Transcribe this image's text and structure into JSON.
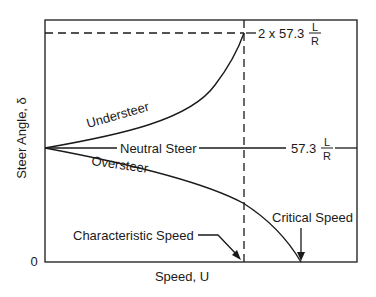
{
  "diagram": {
    "title": "",
    "x_axis": {
      "label": "Speed, U",
      "origin_label": "0"
    },
    "y_axis": {
      "label": "Steer Angle, δ"
    },
    "curves": [
      {
        "name": "Understeer",
        "label": "Understeer"
      },
      {
        "name": "Neutral Steer",
        "label": "Neutral Steer"
      },
      {
        "name": "Oversteer",
        "label": "Oversteer"
      }
    ],
    "annotations": {
      "upper_level_prefix": "2 x 57.3",
      "neutral_level_prefix": "57.3",
      "fraction_numerator": "L",
      "fraction_denominator": "R",
      "characteristic_speed": "Characteristic Speed",
      "critical_speed": "Critical Speed"
    }
  },
  "colors": {
    "ink": "#1a1a1a",
    "background": "#ffffff"
  }
}
